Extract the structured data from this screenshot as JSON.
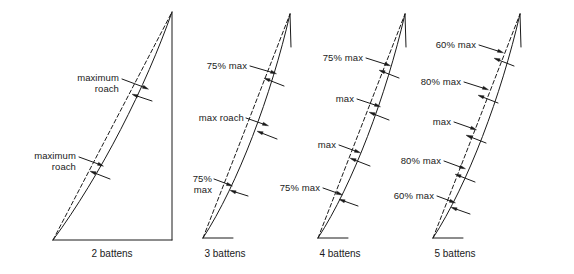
{
  "figure": {
    "background_color": "#ffffff",
    "line_color": "#1a1a1a",
    "panels": [
      {
        "id": "panel-2-battens",
        "caption": "2 battens",
        "caption_x": 112,
        "caption_y": 248,
        "outline": "full-triangle",
        "apex": [
          172,
          12
        ],
        "tack": [
          53,
          240
        ],
        "clew": [
          172,
          240
        ],
        "leech_solid": "M53,240 C101,175 146,86 172,12",
        "leech_dashed": "M53,240 L172,12",
        "head_stub": null,
        "foot_stub": null,
        "labels": [
          {
            "text": "maximum\nroach",
            "x": 57,
            "y": 72,
            "align": "right",
            "width": 62,
            "leader": "M122,79 L146,88",
            "arrow": [
              148.5,
              89.2,
              24,
              "solid"
            ],
            "free_arrow": "M152,101 L134,95",
            "free_arrow_tip": [
              132,
              94.2,
              200,
              "dashed"
            ]
          },
          {
            "text": "maximum\nroach",
            "x": 14,
            "y": 150,
            "align": "right",
            "width": 62,
            "leader": "M79,157 L101,165",
            "arrow": [
              103.5,
              166.2,
              24,
              "solid"
            ],
            "free_arrow": "M110,179 L92,172",
            "free_arrow_tip": [
              90,
              171.2,
              200,
              "dashed"
            ]
          }
        ]
      },
      {
        "id": "panel-3-battens",
        "caption": "3 battens",
        "caption_x": 225,
        "caption_y": 248,
        "outline": "leech-only",
        "apex": [
          290,
          14
        ],
        "tack": [
          203,
          238
        ],
        "leech_solid": "M203,238 C238,184 271,96 290,14",
        "leech_dashed": "M203,238 L290,14",
        "head_stub": "M290,14 L291,47",
        "foot_stub": "M203,238 L233,238",
        "labels": [
          {
            "text": "75% max",
            "x": 195,
            "y": 60,
            "align": "right",
            "width": 52,
            "leader": "M250,66 L274,73",
            "arrow": [
              276.5,
              73.8,
              20,
              "solid"
            ],
            "free_arrow": "M284,86 L266,79",
            "free_arrow_tip": [
              264,
              78.2,
              200,
              "dashed"
            ]
          },
          {
            "text": "max roach",
            "x": 182,
            "y": 112,
            "align": "right",
            "width": 62,
            "leader": "M246,118 L266,125",
            "arrow": [
              268.5,
              125.8,
              20,
              "solid"
            ],
            "free_arrow": "M277,139 L259,132",
            "free_arrow_tip": [
              257,
              131.2,
              200,
              "dashed"
            ]
          },
          {
            "text": "75%\nmax",
            "x": 186,
            "y": 173,
            "align": "right",
            "width": 26,
            "leader": "M214,179 L230,185",
            "arrow": [
              232.5,
              186,
              20,
              "solid"
            ],
            "free_arrow": "M248,196 L232,191",
            "free_arrow_tip": [
              230,
              190.3,
              200,
              "dashed"
            ]
          }
        ]
      },
      {
        "id": "panel-4-battens",
        "caption": "4 battens",
        "caption_x": 340,
        "caption_y": 248,
        "outline": "leech-only",
        "apex": [
          405,
          14
        ],
        "tack": [
          318,
          238
        ],
        "leech_solid": "M318,238 C353,184 386,96 405,14",
        "leech_dashed": "M318,238 L405,14",
        "head_stub": "M405,14 L406,47",
        "foot_stub": "M318,238 L348,238",
        "labels": [
          {
            "text": "75% max",
            "x": 311,
            "y": 52,
            "align": "right",
            "width": 52,
            "leader": "M366,58 L388,65",
            "arrow": [
              390.5,
              65.8,
              20,
              "solid"
            ],
            "free_arrow": "M399,78 L381,71",
            "free_arrow_tip": [
              379,
              70.2,
              200,
              "dashed"
            ]
          },
          {
            "text": "max",
            "x": 330,
            "y": 93,
            "align": "right",
            "width": 24,
            "leader": "M357,99 L378,106",
            "arrow": [
              380.5,
              106.8,
              20,
              "solid"
            ],
            "free_arrow": "M389,120 L371,113",
            "free_arrow_tip": [
              369,
              112.2,
              200,
              "dashed"
            ]
          },
          {
            "text": "max",
            "x": 312,
            "y": 139,
            "align": "right",
            "width": 24,
            "leader": "M339,145 L358,152",
            "arrow": [
              360.5,
              152.8,
              20,
              "solid"
            ],
            "free_arrow": "M370,166 L352,159",
            "free_arrow_tip": [
              350,
              158.2,
              200,
              "dashed"
            ]
          },
          {
            "text": "75% max",
            "x": 268,
            "y": 182,
            "align": "right",
            "width": 52,
            "leader": "M323,188 L340,194",
            "arrow": [
              342.5,
              194.9,
              20,
              "solid"
            ],
            "free_arrow": "M358,206 L341,200",
            "free_arrow_tip": [
              339,
              199.3,
              200,
              "dashed"
            ]
          }
        ]
      },
      {
        "id": "panel-5-battens",
        "caption": "5 battens",
        "caption_x": 455,
        "caption_y": 248,
        "outline": "leech-only",
        "apex": [
          520,
          14
        ],
        "tack": [
          433,
          238
        ],
        "leech_solid": "M433,238 C468,184 501,96 520,14",
        "leech_dashed": "M433,238 L520,14",
        "head_stub": "M520,14 L521,47",
        "foot_stub": "M433,238 L463,238",
        "labels": [
          {
            "text": "60% max",
            "x": 424,
            "y": 39,
            "align": "right",
            "width": 52,
            "leader": "M479,45 L501,52",
            "arrow": [
              503.5,
              52.8,
              20,
              "solid"
            ],
            "free_arrow": "M514,66 L496,59",
            "free_arrow_tip": [
              494,
              58.2,
              200,
              "dashed"
            ]
          },
          {
            "text": "80% max",
            "x": 409,
            "y": 76,
            "align": "right",
            "width": 52,
            "leader": "M464,82 L486,89",
            "arrow": [
              488.5,
              89.8,
              20,
              "solid"
            ],
            "free_arrow": "M498,103 L480,96",
            "free_arrow_tip": [
              478,
              95.2,
              200,
              "dashed"
            ]
          },
          {
            "text": "max",
            "x": 427,
            "y": 116,
            "align": "right",
            "width": 24,
            "leader": "M454,122 L474,129",
            "arrow": [
              476.5,
              129.8,
              20,
              "solid"
            ],
            "free_arrow": "M486,143 L468,136",
            "free_arrow_tip": [
              466,
              135.2,
              200,
              "dashed"
            ]
          },
          {
            "text": "80% max",
            "x": 389,
            "y": 155,
            "align": "right",
            "width": 52,
            "leader": "M444,161 L463,168",
            "arrow": [
              465.5,
              168.8,
              20,
              "solid"
            ],
            "free_arrow": "M475,182 L457,175",
            "free_arrow_tip": [
              455,
              174.2,
              200,
              "dashed"
            ]
          },
          {
            "text": "60% max",
            "x": 382,
            "y": 190,
            "align": "right",
            "width": 52,
            "leader": "M437,196 L453,202",
            "arrow": [
              455.5,
              202.9,
              20,
              "solid"
            ],
            "free_arrow": "M470,214 L453,208",
            "free_arrow_tip": [
              451,
              207.3,
              200,
              "dashed"
            ]
          }
        ]
      }
    ]
  }
}
